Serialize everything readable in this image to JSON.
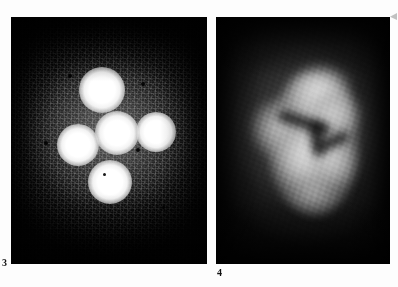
{
  "figure": {
    "background_color": "#fdfdfd",
    "panels": [
      {
        "id": "panel-3",
        "label": "3",
        "kind": "raw-ccd-frame",
        "description": "Noisy monochrome CCD frame showing five resolved point sources in a cross-like configuration on a grainy, vignetted background",
        "x": 11,
        "y": 17,
        "width": 196,
        "height": 247,
        "background_color": "#080808",
        "source_color": "#ffffff",
        "sources": [
          {
            "name": "source-a-north",
            "cx": 91,
            "cy": 73,
            "r": 23,
            "peak": "#ffffff"
          },
          {
            "name": "source-b-west",
            "cx": 67,
            "cy": 128,
            "r": 21,
            "peak": "#ffffff"
          },
          {
            "name": "source-c-center",
            "cx": 106,
            "cy": 116,
            "r": 22,
            "peak": "#ffffff"
          },
          {
            "name": "source-d-east",
            "cx": 145,
            "cy": 115,
            "r": 20,
            "peak": "#ffffff"
          },
          {
            "name": "source-e-south",
            "cx": 99,
            "cy": 165,
            "r": 22,
            "peak": "#ffffff"
          }
        ],
        "dead_pixels": [
          {
            "cx": 58,
            "cy": 58,
            "r": 2
          },
          {
            "cx": 131,
            "cy": 66,
            "r": 2
          },
          {
            "cx": 34,
            "cy": 125,
            "r": 2
          },
          {
            "cx": 126,
            "cy": 132,
            "r": 2
          },
          {
            "cx": 93,
            "cy": 157,
            "r": 2
          },
          {
            "cx": 152,
            "cy": 190,
            "r": 2
          }
        ]
      },
      {
        "id": "panel-4",
        "label": "4",
        "kind": "smoothed-frame",
        "description": "Smoothed / deconvolved monochrome frame of the same field showing a diffuse bright nebulosity with dark absorption lanes near the centre",
        "x": 216,
        "y": 17,
        "width": 174,
        "height": 247,
        "background_color": "#060606",
        "highlight_color": "#d8d8d8",
        "bright_regions": [
          {
            "name": "lobe-north",
            "cx": 101,
            "cy": 78,
            "rx": 31,
            "ry": 26,
            "brightness": "#e0e0e0"
          },
          {
            "name": "lobe-northeast",
            "cx": 118,
            "cy": 96,
            "rx": 25,
            "ry": 22,
            "brightness": "#d2d2d2"
          },
          {
            "name": "lobe-west",
            "cx": 60,
            "cy": 110,
            "rx": 24,
            "ry": 26,
            "brightness": "#c8c8c8"
          },
          {
            "name": "lobe-south",
            "cx": 90,
            "cy": 140,
            "rx": 30,
            "ry": 28,
            "brightness": "#dcdcdc"
          },
          {
            "name": "lobe-southeast",
            "cx": 116,
            "cy": 142,
            "rx": 22,
            "ry": 24,
            "brightness": "#cfcfcf"
          },
          {
            "name": "tail-south",
            "cx": 96,
            "cy": 176,
            "rx": 20,
            "ry": 16,
            "brightness": "#b4b4b4"
          }
        ],
        "dark_lanes": [
          {
            "name": "lane-upper-diagonal",
            "cx": 88,
            "cy": 105,
            "w": 54,
            "h": 11,
            "rot": 18
          },
          {
            "name": "lane-vertical-core",
            "cx": 101,
            "cy": 122,
            "w": 13,
            "h": 34,
            "rot": -8
          },
          {
            "name": "lane-lower-right",
            "cx": 118,
            "cy": 124,
            "w": 30,
            "h": 10,
            "rot": -24
          }
        ]
      }
    ],
    "marks": [
      {
        "name": "corner-mark",
        "position": "top-right"
      }
    ]
  }
}
